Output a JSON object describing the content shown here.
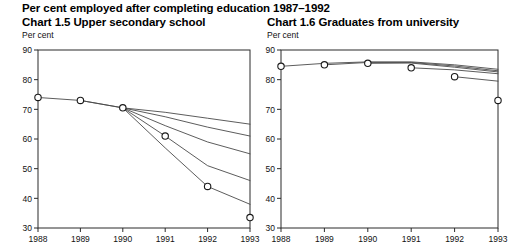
{
  "header": {
    "main_title": "Per cent employed after completing education 1987–1992"
  },
  "charts": {
    "left": {
      "title": "Chart 1.5  Upper secondary school",
      "unit_label": "Per cent"
    },
    "right": {
      "title": "Chart 1.6  Graduates from university",
      "unit_label": "Per cent"
    }
  },
  "chart_data": [
    {
      "type": "line",
      "id": "chart-1-5",
      "title": "Chart 1.5  Upper secondary school",
      "xlabel": "",
      "ylabel": "Per cent",
      "ylim": [
        30,
        90
      ],
      "yticks": [
        30,
        40,
        50,
        60,
        70,
        80,
        90
      ],
      "xticks": [
        "1988",
        "1989",
        "1990",
        "1991",
        "1992",
        "1993"
      ],
      "x": [
        1988,
        1989,
        1990,
        1991,
        1992,
        1993
      ],
      "grid": false,
      "legend": "none",
      "markers": {
        "name": "Observed (circles)",
        "x": [
          1988,
          1989,
          1990,
          1991,
          1992,
          1993
        ],
        "values": [
          74,
          73,
          70.5,
          61,
          44,
          33.5
        ],
        "marker": "open-circle"
      },
      "series": [
        {
          "name": "Cohort 1987",
          "x": [
            1988,
            1989,
            1990,
            1991,
            1992,
            1993
          ],
          "values": [
            74,
            73,
            70.5,
            69,
            67,
            65
          ]
        },
        {
          "name": "Cohort 1988",
          "x": [
            1989,
            1990,
            1991,
            1992,
            1993
          ],
          "values": [
            73,
            70.5,
            67.5,
            64,
            61
          ]
        },
        {
          "name": "Cohort 1989",
          "x": [
            1990,
            1991,
            1992,
            1993
          ],
          "values": [
            70.5,
            64.5,
            59,
            55
          ]
        },
        {
          "name": "Cohort 1990",
          "x": [
            1990,
            1991,
            1992,
            1993
          ],
          "values": [
            70.5,
            61,
            51,
            46
          ]
        },
        {
          "name": "Cohort 1991",
          "x": [
            1990,
            1991,
            1992,
            1993
          ],
          "values": [
            70.5,
            57,
            44,
            38
          ]
        }
      ]
    },
    {
      "type": "line",
      "id": "chart-1-6",
      "title": "Chart 1.6  Graduates from university",
      "xlabel": "",
      "ylabel": "Per cent",
      "ylim": [
        30,
        90
      ],
      "yticks": [
        30,
        40,
        50,
        60,
        70,
        80,
        90
      ],
      "xticks": [
        "1988",
        "1989",
        "1990",
        "1991",
        "1992",
        "1993"
      ],
      "x": [
        1988,
        1989,
        1990,
        1991,
        1992,
        1993
      ],
      "grid": false,
      "legend": "none",
      "markers": {
        "name": "Observed (circles)",
        "x": [
          1988,
          1989,
          1990,
          1991,
          1992,
          1993
        ],
        "values": [
          84.5,
          85,
          85.5,
          84,
          81,
          73
        ],
        "marker": "open-circle"
      },
      "series": [
        {
          "name": "Cohort 1987",
          "x": [
            1988,
            1989,
            1990,
            1991,
            1992,
            1993
          ],
          "values": [
            84.5,
            85.5,
            86,
            86,
            85,
            83.5
          ]
        },
        {
          "name": "Cohort 1988",
          "x": [
            1989,
            1990,
            1991,
            1992,
            1993
          ],
          "values": [
            85,
            85.8,
            85.8,
            84.6,
            83
          ]
        },
        {
          "name": "Cohort 1989",
          "x": [
            1990,
            1991,
            1992,
            1993
          ],
          "values": [
            85.5,
            85.6,
            84.2,
            82.6
          ]
        },
        {
          "name": "Cohort 1990",
          "x": [
            1991,
            1992,
            1993
          ],
          "values": [
            84,
            83.3,
            82
          ]
        },
        {
          "name": "Cohort 1991",
          "x": [
            1992,
            1993
          ],
          "values": [
            81,
            79.5
          ]
        }
      ]
    }
  ]
}
